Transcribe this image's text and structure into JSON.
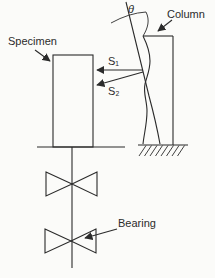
{
  "figure": {
    "labels": {
      "specimen": "Specimen",
      "column": "Column",
      "bearing": "Bearing",
      "theta": "θ",
      "s1": "S₁",
      "s2": "S₂"
    },
    "colors": {
      "ink": "#2b2b2b",
      "paper": "#fbfbf9"
    }
  }
}
